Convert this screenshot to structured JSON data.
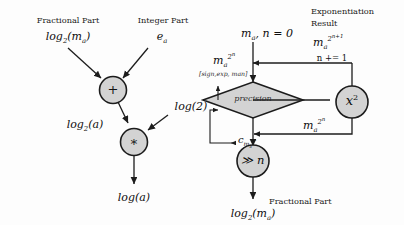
{
  "figure": {
    "type": "flow-diagram",
    "panels": [
      {
        "id": "left",
        "name": "logarithm-reconstruction",
        "nodes": [
          {
            "id": "add",
            "op": "+",
            "shape": "circle"
          },
          {
            "id": "mul",
            "op": "*",
            "shape": "circle"
          }
        ],
        "labels": {
          "frac_caption": "Fractional Part",
          "int_caption": "Integer Part",
          "frac_value": "log₂(mₐ)",
          "int_value": "eₐ",
          "const_log2": "log(2)",
          "intermediate": "log₂(a)",
          "output": "log(a)"
        }
      },
      {
        "id": "right",
        "name": "exponentiation-loop",
        "nodes": [
          {
            "id": "precision",
            "label": "precision",
            "shape": "diamond"
          },
          {
            "id": "square",
            "label": "x²",
            "shape": "circle"
          },
          {
            "id": "shift",
            "label": "≫ n",
            "shape": "circle"
          }
        ],
        "labels": {
          "init": "mₐ, n = 0",
          "exp_result_caption_line1": "Exponentiation",
          "exp_result_caption_line2": "Result",
          "exp_result_value": "mₐ^{2^{n+1}}",
          "increment": "n += 1",
          "feedback_value": "mₐ^{2^{n}}",
          "loop_in_value": "mₐ^{2^{n}}",
          "format_annotation": "[sign,exp, man]",
          "count_value": "c",
          "count_subscript": "mₐ^{2^n}",
          "out_caption": "Fractional Part",
          "out_value": "log₂(mₐ)"
        }
      }
    ],
    "colors": {
      "node_fill": "#d3d3d3",
      "stroke": "#1c1c1c",
      "text": "#111111",
      "background": "#fdfdfd"
    }
  }
}
